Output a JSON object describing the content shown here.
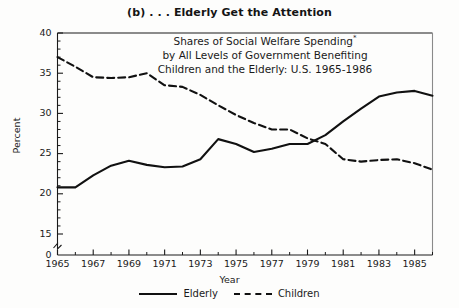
{
  "figure": {
    "title": "(b) . . . Elderly Get the Attention",
    "subtitle_line1": "Shares of Social Welfare Spending",
    "subtitle_sup": "*",
    "subtitle_line2": "by All Levels of Government Benefiting",
    "subtitle_line3": "Children and the Elderly: U.S. 1965-1986"
  },
  "legend": {
    "elderly_label": "Elderly",
    "children_label": "Children"
  },
  "chart_data": {
    "type": "line",
    "title": "(b) . . . Elderly Get the Attention",
    "subtitle": "Shares of Social Welfare Spending* by All Levels of Government Benefiting Children and the Elderly: U.S. 1965-1986",
    "xlabel": "Year",
    "ylabel": "Percent",
    "xlim": [
      1965,
      1986
    ],
    "ylim": [
      15,
      40
    ],
    "y_axis_break_below": 15,
    "y_zero_shown": true,
    "yticks": [
      40,
      35,
      30,
      25,
      20,
      15,
      0
    ],
    "ytick_labels": [
      "40",
      "35",
      "30",
      "25",
      "20",
      "15",
      "0"
    ],
    "y_minor_tick_interval": 1,
    "xticks": [
      1965,
      1967,
      1969,
      1971,
      1973,
      1975,
      1977,
      1979,
      1981,
      1983,
      1985
    ],
    "xtick_labels": [
      "1965",
      "1967",
      "1969",
      "1971",
      "1973",
      "1975",
      "1977",
      "1979",
      "1981",
      "1983",
      "1985"
    ],
    "x_minor_tick_interval": 1,
    "grid": false,
    "legend_position": "below-center",
    "x": [
      1965,
      1966,
      1967,
      1968,
      1969,
      1970,
      1971,
      1972,
      1973,
      1974,
      1975,
      1976,
      1977,
      1978,
      1979,
      1980,
      1981,
      1982,
      1983,
      1984,
      1985,
      1986
    ],
    "series": [
      {
        "name": "Elderly",
        "style": "solid",
        "color": "#111111",
        "values": [
          20.8,
          20.8,
          22.3,
          23.5,
          24.1,
          23.6,
          23.3,
          23.4,
          24.3,
          26.8,
          26.2,
          25.2,
          25.6,
          26.2,
          26.2,
          27.3,
          29.0,
          30.6,
          32.1,
          32.6,
          32.8,
          32.2
        ]
      },
      {
        "name": "Children",
        "style": "dashed",
        "color": "#111111",
        "values": [
          37.0,
          35.8,
          34.5,
          34.4,
          34.5,
          35.0,
          33.5,
          33.3,
          32.3,
          31.0,
          29.8,
          28.8,
          28.0,
          28.0,
          26.9,
          26.2,
          24.3,
          24.0,
          24.2,
          24.3,
          23.8,
          23.0
        ]
      }
    ],
    "annotations": [
      {
        "text": "Lines cross near 1980 as Elderly share overtakes Children share"
      }
    ]
  }
}
